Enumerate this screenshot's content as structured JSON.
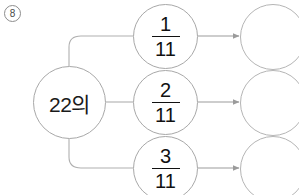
{
  "problem": {
    "number": "8",
    "number_icon": "circled-number"
  },
  "colors": {
    "stroke": "#a8a8a8",
    "text": "#111111",
    "background": "#ffffff",
    "problem_number_text": "#4a4a4a"
  },
  "diagram": {
    "type": "fraction-branch-map",
    "source_node": {
      "label": "22의",
      "cx": 69,
      "cy": 102,
      "r": 36
    },
    "branches": [
      {
        "fraction": {
          "numerator": "1",
          "denominator": "11"
        },
        "cx": 165,
        "cy": 36,
        "r": 32,
        "answer": {
          "value": "",
          "cx": 273,
          "cy": 37,
          "r": 33
        },
        "arrow": "arrow-right"
      },
      {
        "fraction": {
          "numerator": "2",
          "denominator": "11"
        },
        "cx": 165,
        "cy": 102,
        "r": 32,
        "answer": {
          "value": "",
          "cx": 273,
          "cy": 103,
          "r": 33
        },
        "arrow": "arrow-right"
      },
      {
        "fraction": {
          "numerator": "3",
          "denominator": "11"
        },
        "cx": 165,
        "cy": 168,
        "r": 32,
        "answer": {
          "value": "",
          "cx": 273,
          "cy": 169,
          "r": 33
        },
        "arrow": "arrow-right"
      }
    ]
  }
}
